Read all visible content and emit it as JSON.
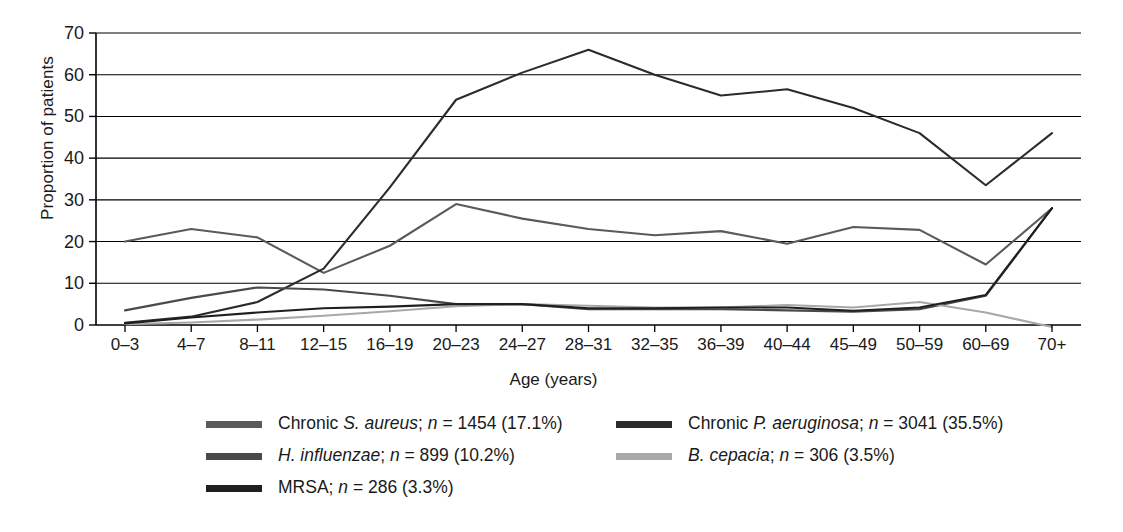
{
  "chart_data": {
    "type": "line",
    "title": "",
    "xlabel": "Age (years)",
    "ylabel": "Proportion of patients",
    "categories": [
      "0–3",
      "4–7",
      "8–11",
      "12–15",
      "16–19",
      "20–23",
      "24–27",
      "28–31",
      "32–35",
      "36–39",
      "40–44",
      "45–49",
      "50–59",
      "60–69",
      "70+"
    ],
    "ylim": [
      0,
      70
    ],
    "yticks": [
      0,
      10,
      20,
      30,
      40,
      50,
      60,
      70
    ],
    "grid": "horizontal",
    "legend_position": "below",
    "series": [
      {
        "name": "Chronic S. aureus",
        "n": 1454,
        "percent": "17.1%",
        "color": "#5a5a5a",
        "values": [
          20.0,
          23.0,
          21.0,
          12.5,
          19.0,
          29.0,
          25.5,
          23.0,
          21.5,
          22.5,
          19.5,
          23.5,
          22.8,
          14.5,
          28.0
        ]
      },
      {
        "name": "Chronic P. aeruginosa",
        "n": 3041,
        "percent": "35.5%",
        "color": "#2b2b2b",
        "values": [
          0.5,
          2.0,
          5.5,
          13.5,
          33.0,
          54.0,
          60.5,
          66.0,
          60.0,
          55.0,
          56.5,
          52.0,
          46.0,
          33.5,
          46.0
        ]
      },
      {
        "name": "H. influenzae",
        "n": 899,
        "percent": "10.2%",
        "color": "#4a4a4a",
        "values": [
          3.5,
          6.5,
          9.0,
          8.5,
          7.0,
          5.0,
          5.0,
          3.8,
          3.8,
          3.8,
          3.5,
          3.2,
          3.8,
          7.0,
          28.0
        ]
      },
      {
        "name": "B. cepacia",
        "n": 306,
        "percent": "3.5%",
        "color": "#a8a8a8",
        "values": [
          0.2,
          0.6,
          1.3,
          2.2,
          3.3,
          4.5,
          5.0,
          4.6,
          4.2,
          4.2,
          4.8,
          4.2,
          5.5,
          3.0,
          -0.5
        ]
      },
      {
        "name": "MRSA",
        "n": 286,
        "percent": "3.3%",
        "color": "#1f1f1f",
        "values": [
          0.4,
          1.8,
          3.0,
          4.0,
          4.4,
          5.0,
          5.0,
          4.0,
          4.0,
          4.2,
          4.2,
          3.4,
          4.2,
          7.2,
          28.0
        ]
      }
    ]
  },
  "axis": {
    "y_label": "Proportion of patients",
    "x_label": "Age (years)",
    "y_ticks": [
      "0",
      "10",
      "20",
      "30",
      "40",
      "50",
      "60",
      "70"
    ],
    "x_ticks": [
      "0–3",
      "4–7",
      "8–11",
      "12–15",
      "16–19",
      "20–23",
      "24–27",
      "28–31",
      "32–35",
      "36–39",
      "40–44",
      "45–49",
      "50–59",
      "60–69",
      "70+"
    ]
  },
  "legend": {
    "rows": [
      {
        "left": {
          "swatch_name": "legend-swatch-chronic-s-aureus",
          "color": "#5a5a5a",
          "prefix": "Chronic ",
          "italic": "S. aureus",
          "suffix": "; ",
          "nvar": "n",
          "stat": " = 1454 (17.1%)"
        },
        "right": {
          "swatch_name": "legend-swatch-chronic-p-aeruginosa",
          "color": "#2b2b2b",
          "prefix": "Chronic ",
          "italic": "P. aeruginosa",
          "suffix": "; ",
          "nvar": "n",
          "stat": " = 3041 (35.5%)"
        }
      },
      {
        "left": {
          "swatch_name": "legend-swatch-h-influenzae",
          "color": "#4a4a4a",
          "prefix": "",
          "italic": "H. influenzae",
          "suffix": "; ",
          "nvar": "n",
          "stat": " = 899 (10.2%)"
        },
        "right": {
          "swatch_name": "legend-swatch-b-cepacia",
          "color": "#a8a8a8",
          "prefix": "",
          "italic": "B. cepacia",
          "suffix": "; ",
          "nvar": "n",
          "stat": " = 306 (3.5%)"
        }
      },
      {
        "left": {
          "swatch_name": "legend-swatch-mrsa",
          "color": "#1f1f1f",
          "prefix": "MRSA",
          "italic": "",
          "suffix": "; ",
          "nvar": "n",
          "stat": " = 286 (3.3%)"
        },
        "right": null
      }
    ]
  }
}
